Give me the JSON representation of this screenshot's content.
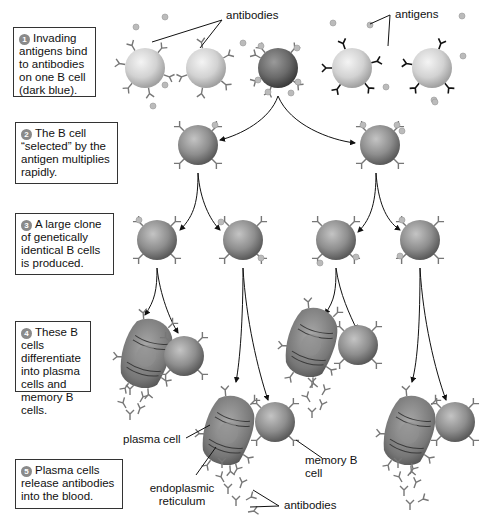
{
  "diagram": {
    "colors": {
      "selected_cell": "#555555",
      "other_cell": "#d8d8d8",
      "line": "#222222",
      "box_border": "#333333",
      "badge": "#8a8a8a"
    },
    "steps": [
      {
        "number": "1",
        "text": "Invading antigens bind to antibodies on one B cell (dark blue)."
      },
      {
        "number": "2",
        "text": "The B cell “selected” by the antigen multiplies rapidly."
      },
      {
        "number": "3",
        "text": "A large clone of genetically identical B cells is produced."
      },
      {
        "number": "4",
        "text": "These B cells differentiate into plasma cells and memory B cells."
      },
      {
        "number": "5",
        "text": "Plasma cells release antibodies into the blood."
      }
    ],
    "labels": {
      "antibodies_top": "antibodies",
      "antigens": "antigens",
      "plasma_cell": "plasma cell",
      "endoplasmic_reticulum_1": "endoplasmic",
      "endoplasmic_reticulum_2": "reticulum",
      "memory_b_cell_1": "memory B",
      "memory_b_cell_2": "cell",
      "antibodies_bottom": "antibodies"
    }
  }
}
